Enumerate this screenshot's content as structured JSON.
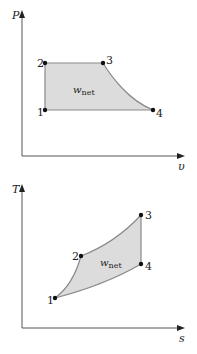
{
  "diagrams": [
    {
      "id": "pv",
      "y_axis_label": "P",
      "x_axis_label": "υ",
      "area_label": "w",
      "area_label_sub": "net",
      "points": [
        {
          "label": "1",
          "x": 45,
          "y": 110
        },
        {
          "label": "2",
          "x": 45,
          "y": 63
        },
        {
          "label": "3",
          "x": 103,
          "y": 63
        },
        {
          "label": "4",
          "x": 153,
          "y": 110
        }
      ]
    },
    {
      "id": "ts",
      "y_axis_label": "T",
      "x_axis_label": "s",
      "area_label": "w",
      "area_label_sub": "net",
      "points": [
        {
          "label": "1",
          "x": 55,
          "y": 298
        },
        {
          "label": "2",
          "x": 81,
          "y": 256
        },
        {
          "label": "3",
          "x": 141,
          "y": 215
        },
        {
          "label": "4",
          "x": 141,
          "y": 264
        }
      ]
    }
  ],
  "colors": {
    "fill": "#dcdcdc",
    "process_line": "#8a8a8a",
    "axis": "#555555",
    "point": "#111111"
  }
}
